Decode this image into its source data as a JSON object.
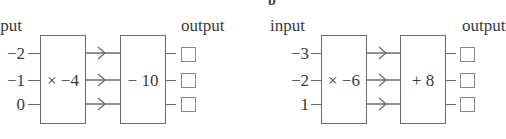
{
  "diagram_a": {
    "input_label": "input",
    "output_label": "output",
    "inputs": [
      "−2",
      "−1",
      "0"
    ],
    "machine1": "× −4",
    "machine2": "− 10",
    "outputs": [
      "",
      "",
      ""
    ]
  },
  "diagram_b": {
    "part_label": "b",
    "input_label": "input",
    "output_label": "output",
    "inputs": [
      "−3",
      "−2",
      "1"
    ],
    "machine1": "× −6",
    "machine2": "+ 8",
    "outputs": [
      "",
      "",
      ""
    ]
  }
}
